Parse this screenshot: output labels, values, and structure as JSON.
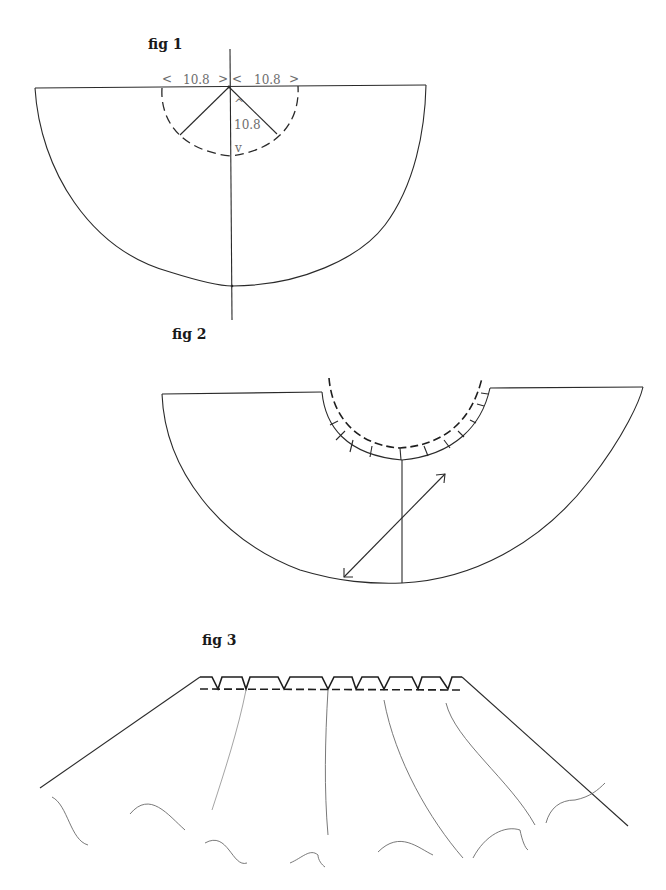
{
  "figures": [
    {
      "id": "fig1",
      "label": "fig 1",
      "description": "Half-circle skirt pattern with waist radius construction",
      "dimensions": {
        "left_width": "10.8",
        "right_width": "10.8",
        "radius": "10.8"
      },
      "arrows": {
        "left_open": "<",
        "left_close": ">",
        "right_open": "<",
        "right_close": ">",
        "up": "^",
        "down": "v"
      }
    },
    {
      "id": "fig2",
      "label": "fig 2",
      "description": "Cut-out waist curve with seam allowance notches, center line and grainline arrow"
    },
    {
      "id": "fig3",
      "label": "fig 3",
      "description": "Gathered/pleated skirt with waistband pleats and flowing hem"
    }
  ],
  "colors": {
    "ink": "#2a2a2a",
    "dimension_text": "#6d6d6d",
    "background": "#ffffff"
  }
}
